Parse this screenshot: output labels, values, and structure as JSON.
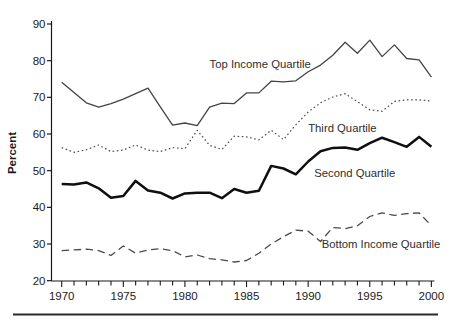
{
  "chart_data": {
    "type": "line",
    "title": "",
    "xlabel": "",
    "ylabel": "Percent",
    "xlim": [
      1970,
      2000
    ],
    "ylim": [
      20,
      90
    ],
    "grid": false,
    "legend_position": "inline-annotations",
    "x": [
      1970,
      1971,
      1972,
      1973,
      1974,
      1975,
      1976,
      1977,
      1978,
      1979,
      1980,
      1981,
      1982,
      1983,
      1984,
      1985,
      1986,
      1987,
      1988,
      1989,
      1990,
      1991,
      1992,
      1993,
      1994,
      1995,
      1996,
      1997,
      1998,
      1999,
      2000
    ],
    "x_tick_labels": [
      "1970",
      "1975",
      "1980",
      "1985",
      "1990",
      "1995",
      "2000"
    ],
    "y_tick_labels": [
      "20",
      "30",
      "40",
      "50",
      "60",
      "70",
      "80",
      "90"
    ],
    "series": [
      {
        "name": "Top Income Quartile",
        "line_style": "solid",
        "stroke_weight": "thin",
        "color": "#444444",
        "label_anchor": {
          "year": 1982.0,
          "percent": 78.0
        },
        "values": [
          74.1,
          71.3,
          68.5,
          67.3,
          68.3,
          69.5,
          71.0,
          72.5,
          67.4,
          62.4,
          63.0,
          62.3,
          67.3,
          68.4,
          68.3,
          71.2,
          71.2,
          74.4,
          74.2,
          74.5,
          77.0,
          78.8,
          81.5,
          85.0,
          82.0,
          85.6,
          81.1,
          84.3,
          80.6,
          80.2,
          75.5
        ]
      },
      {
        "name": "Third Quartile",
        "line_style": "dotted",
        "stroke_weight": "thin",
        "color": "#4f4f4f",
        "label_anchor": {
          "year": 1990.0,
          "percent": 60.5
        },
        "values": [
          56.3,
          55.0,
          55.7,
          57.0,
          55.2,
          55.6,
          57.0,
          55.6,
          55.2,
          56.3,
          56.0,
          61.0,
          56.9,
          55.8,
          59.4,
          59.2,
          58.4,
          61.0,
          58.5,
          62.5,
          66.0,
          68.5,
          70.1,
          71.0,
          68.8,
          66.6,
          66.2,
          68.9,
          69.3,
          69.3,
          69.0
        ]
      },
      {
        "name": "Second Quartile",
        "line_style": "solid",
        "stroke_weight": "thick",
        "color": "#0f0f0f",
        "label_anchor": {
          "year": 1990.5,
          "percent": 48.3
        },
        "values": [
          46.4,
          46.2,
          46.8,
          45.2,
          42.6,
          43.1,
          47.2,
          44.6,
          44.0,
          42.4,
          43.8,
          44.0,
          44.0,
          42.5,
          45.0,
          44.0,
          44.5,
          51.3,
          50.6,
          49.0,
          52.5,
          55.3,
          56.2,
          56.3,
          55.7,
          57.5,
          59.0,
          57.8,
          56.5,
          59.2,
          56.5
        ]
      },
      {
        "name": "Bottom Income Quartile",
        "line_style": "dashed",
        "stroke_weight": "thin",
        "color": "#4a4a4a",
        "label_anchor": {
          "year": 1991.1,
          "percent": 28.9
        },
        "values": [
          28.2,
          28.4,
          28.6,
          28.2,
          26.9,
          29.5,
          27.5,
          28.4,
          28.7,
          28.2,
          26.5,
          27.0,
          26.0,
          25.7,
          25.1,
          25.5,
          27.5,
          30.0,
          32.0,
          33.8,
          33.5,
          30.7,
          34.5,
          34.2,
          35.0,
          37.5,
          38.5,
          37.8,
          38.3,
          38.5,
          35.0
        ]
      }
    ],
    "axis_color": "#1a1a1a",
    "footer_rule_color": "#2b2b2b"
  }
}
